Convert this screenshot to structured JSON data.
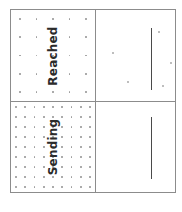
{
  "figure": {
    "width": 182,
    "height": 212,
    "background_color": "#ffffff",
    "frame_color": "#8c8c8c",
    "dot_color": "#9a9a9a",
    "line_color": "#4a4a4a",
    "label_color": "#2b2b2b"
  },
  "panels": {
    "top_left": {
      "label": "Reached",
      "label_rotation": "-90",
      "dot_grid": {
        "columns": 5,
        "rows": 5
      }
    },
    "top_right": {
      "label": "",
      "vline": {
        "x_pct": 69,
        "y_top_pct": 20,
        "y_bottom_pct": 88
      },
      "scatter": [
        {
          "x_pct": 80,
          "y_pct": 24
        },
        {
          "x_pct": 22,
          "y_pct": 47
        },
        {
          "x_pct": 95,
          "y_pct": 58
        },
        {
          "x_pct": 41,
          "y_pct": 79
        },
        {
          "x_pct": 85,
          "y_pct": 83
        }
      ]
    },
    "bottom_left": {
      "label": "Sending",
      "label_rotation": "-90",
      "dot_grid": {
        "columns": 9,
        "rows": 9
      }
    },
    "bottom_right": {
      "label": "",
      "vline": {
        "x_pct": 69,
        "y_top_pct": 17,
        "y_bottom_pct": 86
      },
      "scatter": []
    }
  },
  "chart_data": {
    "type": "scatter",
    "title": "",
    "xlabel": "",
    "ylabel": "",
    "grid": false,
    "legend_position": "none",
    "layout": {
      "rows": 2,
      "cols": 2
    },
    "row_labels": [
      "Reached",
      "Sending"
    ],
    "subplots": [
      {
        "position": "top-left",
        "row_label": "Reached",
        "kind": "dot-lattice",
        "n_columns": 5,
        "n_rows": 5,
        "n_points": 25
      },
      {
        "position": "top-right",
        "row_label": "Reached",
        "kind": "scatter-with-rule",
        "rule_x": 0.69,
        "rule_y_range": [
          0.2,
          0.88
        ],
        "points": [
          [
            0.8,
            0.24
          ],
          [
            0.22,
            0.47
          ],
          [
            0.95,
            0.58
          ],
          [
            0.41,
            0.79
          ],
          [
            0.85,
            0.83
          ]
        ],
        "n_points": 5
      },
      {
        "position": "bottom-left",
        "row_label": "Sending",
        "kind": "dot-lattice",
        "n_columns": 9,
        "n_rows": 9,
        "n_points": 81
      },
      {
        "position": "bottom-right",
        "row_label": "Sending",
        "kind": "scatter-with-rule",
        "rule_x": 0.69,
        "rule_y_range": [
          0.17,
          0.86
        ],
        "points": [],
        "n_points": 0
      }
    ]
  }
}
